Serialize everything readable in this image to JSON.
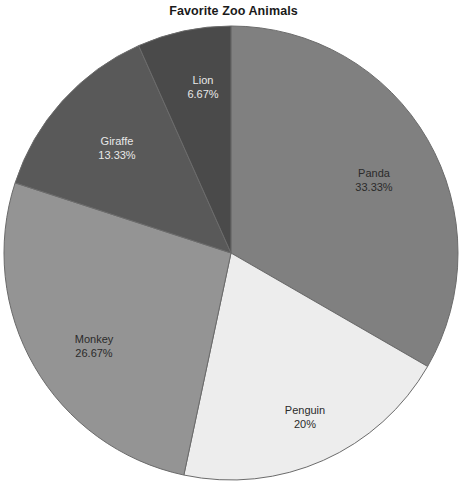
{
  "chart_data": {
    "type": "pie",
    "title": "Favorite Zoo Animals",
    "xlabel": "",
    "ylabel": "",
    "legend_position": "none",
    "grid": false,
    "labels_inside_slices": true,
    "start_angle_deg": 90,
    "direction": "clockwise",
    "categories": [
      "Panda",
      "Penguin",
      "Monkey",
      "Giraffe",
      "Lion"
    ],
    "values": [
      33.33,
      20,
      26.67,
      13.33,
      6.67
    ],
    "value_unit": "percent",
    "slices": [
      {
        "label": "Panda",
        "percent_text": "33.33%",
        "value": 33.33,
        "color": "#808080",
        "label_color": "#2b2b2b",
        "label_x": 374,
        "label_y": 174
      },
      {
        "label": "Penguin",
        "percent_text": "20%",
        "value": 20,
        "color": "#ededed",
        "label_color": "#2b2b2b",
        "label_x": 305,
        "label_y": 411
      },
      {
        "label": "Monkey",
        "percent_text": "26.67%",
        "value": 26.67,
        "color": "#949494",
        "label_color": "#2b2b2b",
        "label_x": 94,
        "label_y": 340
      },
      {
        "label": "Giraffe",
        "percent_text": "13.33%",
        "value": 13.33,
        "color": "#595959",
        "label_color": "#e8e8e8",
        "label_x": 117,
        "label_y": 142
      },
      {
        "label": "Lion",
        "percent_text": "6.67%",
        "value": 6.67,
        "color": "#4a4a4a",
        "label_color": "#e8e8e8",
        "label_x": 203,
        "label_y": 81
      }
    ],
    "geometry": {
      "center_x": 231,
      "center_y": 253,
      "radius": 227
    },
    "colors": {
      "background": "#ffffff",
      "outline": "#6b6b6b",
      "title": "#1a1a1a"
    }
  }
}
